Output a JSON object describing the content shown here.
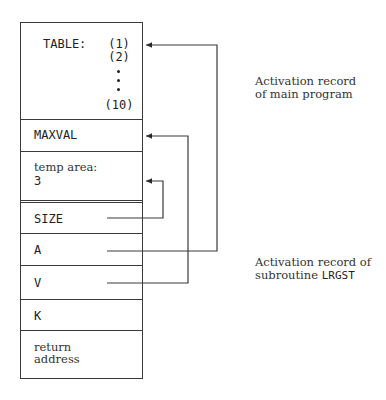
{
  "diagram": {
    "type": "activation-record-stack",
    "main_program": {
      "table_label": "TABLE:",
      "table_indices": [
        "(1)",
        "(2)",
        "(10)"
      ],
      "ellipsis": "vertical-dots",
      "cells": [
        {
          "label": "MAXVAL"
        },
        {
          "label_line1": "temp area:",
          "label_line2": "3"
        }
      ],
      "caption_line1": "Activation record",
      "caption_line2": "of main program"
    },
    "subroutine": {
      "cells": [
        {
          "label": "SIZE"
        },
        {
          "label": "A"
        },
        {
          "label": "V"
        },
        {
          "label": "K"
        },
        {
          "label_line1": "return",
          "label_line2": "address"
        }
      ],
      "caption_line1": "Activation record of",
      "caption_line2_prefix": "subroutine ",
      "caption_line2_name": "LRGST"
    },
    "arrows": [
      {
        "from": "SIZE",
        "to": "temp area"
      },
      {
        "from": "A",
        "to": "TABLE"
      },
      {
        "from": "V",
        "to": "MAXVAL"
      }
    ],
    "colors": {
      "line": "#3a3a3a",
      "text": "#222222"
    }
  }
}
